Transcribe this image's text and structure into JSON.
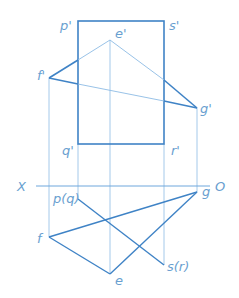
{
  "diagram": {
    "type": "orthographic-projection",
    "colors": {
      "thick": "#3f83c6",
      "thin": "#7fb2e0",
      "label": "#6a9fd0"
    },
    "axis": {
      "left_label": "X",
      "right_label": "O"
    },
    "labels": {
      "p_prime": "p'",
      "s_prime": "s'",
      "q_prime": "q'",
      "r_prime": "r'",
      "e_prime": "e'",
      "f_prime": "f'",
      "g_prime": "g'",
      "pq": "p(q)",
      "sr": "s(r)",
      "e": "e",
      "f": "f",
      "g": "g"
    }
  }
}
